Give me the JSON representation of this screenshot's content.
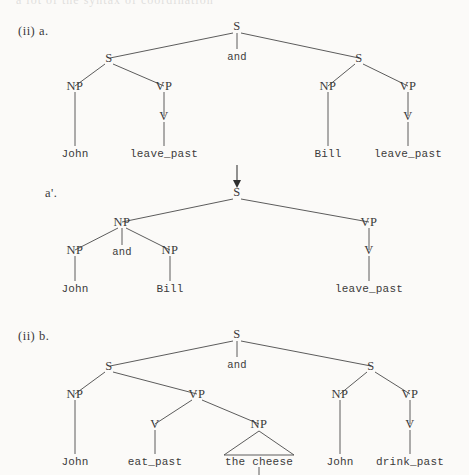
{
  "page": {
    "cut_off_header": "a lot of the syntax of coordination",
    "background_color": "#fbfaf8",
    "ink_color": "#3b3b3b"
  },
  "figures": [
    {
      "id": "fig-ii-a",
      "caption": "(ii) a.",
      "description": "Coordinated sentence tree: S -> S and S",
      "root": "S",
      "conjunction": "and",
      "nonterminals": [
        "S",
        "S",
        "S",
        "NP",
        "VP",
        "V",
        "NP",
        "VP",
        "V"
      ],
      "leaves": [
        "John",
        "leave_past",
        "Bill",
        "leave_past"
      ],
      "left_clause": {
        "root": "S",
        "np": "NP",
        "np_leaf": "John",
        "vp": "VP",
        "v": "V",
        "v_leaf": "leave_past"
      },
      "right_clause": {
        "root": "S",
        "np": "NP",
        "np_leaf": "Bill",
        "vp": "VP",
        "v": "V",
        "v_leaf": "leave_past"
      }
    },
    {
      "id": "fig-ii-a-prime",
      "caption": "a'.",
      "description": "Reduced coordination tree: S -> NP(NP and NP) VP",
      "root": "S",
      "conjunction": "and",
      "subject": {
        "np": "NP",
        "left_np": "NP",
        "left_leaf": "John",
        "right_np": "NP",
        "right_leaf": "Bill"
      },
      "predicate": {
        "vp": "VP",
        "v": "V",
        "v_leaf": "leave_past"
      }
    },
    {
      "id": "fig-ii-b",
      "caption": "(ii) b.",
      "description": "Coordinated sentence tree with transitive and intransitive clauses",
      "root": "S",
      "conjunction": "and",
      "left_clause": {
        "root": "S",
        "np": "NP",
        "np_leaf": "John",
        "vp": "VP",
        "v": "V",
        "v_leaf": "eat_past",
        "object_np": "NP",
        "object_leaf": "the cheese",
        "object_is_triangle": true
      },
      "right_clause": {
        "root": "S",
        "np": "NP",
        "np_leaf": "John",
        "vp": "VP",
        "v": "V",
        "v_leaf": "drink_past"
      }
    }
  ],
  "arrow": {
    "name": "derivation-arrow",
    "direction": "down"
  }
}
